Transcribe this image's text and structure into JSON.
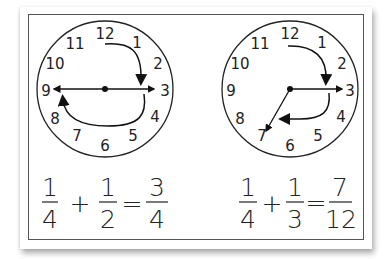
{
  "clocks": [
    {
      "id": "quarter-plus-half",
      "numbers": [
        "12",
        "1",
        "2",
        "3",
        "4",
        "5",
        "6",
        "7",
        "8",
        "9",
        "10",
        "11"
      ],
      "arcs": [
        {
          "from": 12,
          "to": 3,
          "label": "1/4"
        },
        {
          "from": 3,
          "to": 9,
          "label": "1/2"
        }
      ],
      "hands": [
        {
          "to": 3
        },
        {
          "to": 9
        }
      ]
    },
    {
      "id": "quarter-plus-third",
      "numbers": [
        "12",
        "1",
        "2",
        "3",
        "4",
        "5",
        "6",
        "7",
        "8",
        "9",
        "10",
        "11"
      ],
      "arcs": [
        {
          "from": 12,
          "to": 3,
          "label": "1/4"
        },
        {
          "from": 3,
          "to": 7,
          "label": "1/3"
        }
      ],
      "hands": [
        {
          "to": 3
        },
        {
          "to": 7
        }
      ]
    }
  ],
  "equations": [
    {
      "a": {
        "num": "1",
        "den": "4"
      },
      "op": "+",
      "b": {
        "num": "1",
        "den": "2"
      },
      "eq": "=",
      "result": {
        "num": "3",
        "den": "4"
      }
    },
    {
      "a": {
        "num": "1",
        "den": "4"
      },
      "op": "+",
      "b": {
        "num": "1",
        "den": "3"
      },
      "eq": "=",
      "result": {
        "num": "7",
        "den": "12"
      }
    }
  ]
}
